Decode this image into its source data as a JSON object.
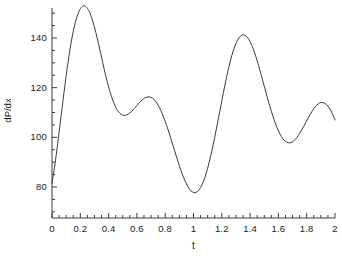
{
  "chart_data": {
    "type": "line",
    "title": "",
    "subtitle": "",
    "xlabel": "t",
    "ylabel": "dP/dx",
    "xlim": [
      0,
      2
    ],
    "ylim": [
      70,
      156
    ],
    "xticks": [
      0,
      0.2,
      0.4,
      0.6,
      0.8,
      1,
      1.2,
      1.4,
      1.6,
      1.8,
      2
    ],
    "xtick_labels": [
      "0",
      "0.2",
      "0.4",
      "0.6",
      "0.8",
      "1",
      "1.2",
      "1.4",
      "1.6",
      "1.8",
      "2"
    ],
    "yticks": [
      80,
      100,
      120,
      140
    ],
    "ytick_labels": [
      "80",
      "100",
      "120",
      "140"
    ],
    "minor_ticks": true,
    "grid": false,
    "legend": null,
    "legend_position": "none",
    "line_color": "#3a3a3a",
    "line_width": 1,
    "background_color": "#ffffff",
    "axis_color": "#3a3a3a",
    "annotations": [],
    "features": {
      "peaks": [
        {
          "t": 0.17,
          "value": 153
        },
        {
          "t": 0.62,
          "value": 124
        },
        {
          "t": 1.17,
          "value": 153
        },
        {
          "t": 1.63,
          "value": 124
        }
      ],
      "valleys": [
        {
          "t": 0.44,
          "value": 103.5
        },
        {
          "t": 0.93,
          "value": 72
        },
        {
          "t": 1.44,
          "value": 103.5
        },
        {
          "t": 1.93,
          "value": 72
        }
      ],
      "endpoints": [
        {
          "t": 0,
          "value": 81.5
        },
        {
          "t": 2,
          "value": 81.5
        }
      ],
      "period": 1.0
    },
    "series": [
      {
        "name": "dP/dx",
        "x": [
          0,
          0.02,
          0.04,
          0.06,
          0.08,
          0.1,
          0.12,
          0.14,
          0.16,
          0.18,
          0.2,
          0.22,
          0.24,
          0.26,
          0.28,
          0.3,
          0.32,
          0.34,
          0.36,
          0.38,
          0.4,
          0.42,
          0.44,
          0.46,
          0.48,
          0.5,
          0.52,
          0.54,
          0.56,
          0.58,
          0.6,
          0.62,
          0.64,
          0.66,
          0.68,
          0.7,
          0.72,
          0.74,
          0.76,
          0.78,
          0.8,
          0.82,
          0.84,
          0.86,
          0.88,
          0.9,
          0.92,
          0.94,
          0.96,
          0.98,
          1.0,
          1.02,
          1.04,
          1.06,
          1.08,
          1.1,
          1.12,
          1.14,
          1.16,
          1.18,
          1.2,
          1.22,
          1.24,
          1.26,
          1.28,
          1.3,
          1.32,
          1.34,
          1.36,
          1.38,
          1.4,
          1.42,
          1.44,
          1.46,
          1.48,
          1.5,
          1.52,
          1.54,
          1.56,
          1.58,
          1.6,
          1.62,
          1.64,
          1.66,
          1.68,
          1.7,
          1.72,
          1.74,
          1.76,
          1.78,
          1.8,
          1.82,
          1.84,
          1.86,
          1.88,
          1.9,
          1.92,
          1.94,
          1.96,
          1.98,
          2.0
        ],
        "y": [
          81.5,
          88.8,
          97.4,
          106.6,
          115.9,
          124.8,
          132.8,
          139.7,
          145.2,
          149.2,
          151.8,
          152.9,
          152.6,
          151.0,
          148.2,
          144.4,
          139.8,
          134.8,
          129.7,
          124.8,
          120.3,
          116.5,
          113.4,
          111.1,
          109.7,
          108.9,
          108.9,
          109.4,
          110.3,
          111.5,
          112.8,
          114.1,
          115.2,
          116.0,
          116.3,
          116.1,
          115.3,
          113.9,
          111.9,
          109.4,
          106.4,
          103.1,
          99.5,
          95.8,
          92.1,
          88.6,
          85.3,
          82.5,
          80.2,
          78.6,
          77.8,
          77.9,
          78.9,
          80.9,
          83.8,
          87.6,
          92.1,
          97.3,
          102.9,
          108.8,
          114.7,
          120.5,
          125.9,
          130.7,
          134.7,
          137.8,
          140.0,
          141.1,
          141.2,
          140.3,
          138.5,
          135.9,
          132.6,
          128.9,
          124.8,
          120.6,
          116.4,
          112.4,
          108.7,
          105.4,
          102.6,
          100.4,
          98.9,
          98.0,
          97.8,
          98.2,
          99.2,
          100.7,
          102.5,
          104.5,
          106.7,
          108.8,
          110.7,
          112.3,
          113.4,
          114.0,
          113.9,
          113.2,
          111.8,
          109.7,
          107.0
        ]
      }
    ],
    "curve_points_px": [
      [
        52,
        183
      ],
      [
        54.5,
        176
      ],
      [
        57,
        169
      ],
      [
        59.5,
        161
      ],
      [
        62,
        152
      ],
      [
        64.5,
        142
      ],
      [
        67,
        131
      ],
      [
        69.5,
        120
      ],
      [
        72,
        108
      ],
      [
        74.5,
        96
      ],
      [
        77,
        84
      ],
      [
        79.5,
        72
      ],
      [
        82,
        60
      ],
      [
        84.5,
        48
      ],
      [
        87,
        38
      ],
      [
        89.5,
        28
      ],
      [
        92,
        21
      ],
      [
        94.5,
        16
      ],
      [
        96.5,
        14
      ],
      [
        99,
        14
      ],
      [
        101.5,
        16
      ],
      [
        104,
        21
      ],
      [
        106.5,
        28
      ],
      [
        109,
        37
      ],
      [
        111.5,
        48
      ],
      [
        114,
        60
      ],
      [
        116.5,
        71
      ],
      [
        119,
        82
      ],
      [
        121.5,
        93
      ],
      [
        124,
        103
      ],
      [
        126.5,
        112
      ],
      [
        129,
        120
      ],
      [
        131.5,
        127
      ],
      [
        134,
        131
      ],
      [
        136.5,
        134
      ],
      [
        139,
        135
      ],
      [
        141.5,
        134
      ],
      [
        144,
        132
      ],
      [
        146.5,
        128
      ],
      [
        149,
        123
      ],
      [
        151.5,
        118
      ],
      [
        154,
        112
      ],
      [
        156.5,
        106
      ],
      [
        159,
        100
      ],
      [
        161.5,
        95
      ],
      [
        164,
        90
      ],
      [
        166.5,
        86
      ],
      [
        169,
        83
      ],
      [
        171.5,
        81
      ],
      [
        174,
        80
      ],
      [
        176.5,
        81
      ],
      [
        179,
        83
      ],
      [
        181.5,
        86
      ],
      [
        184,
        91
      ],
      [
        186.5,
        97
      ],
      [
        189,
        104
      ],
      [
        191.5,
        112
      ],
      [
        194,
        121
      ],
      [
        196.5,
        131
      ],
      [
        199,
        142
      ],
      [
        201.5,
        153
      ],
      [
        204,
        164
      ],
      [
        206.5,
        174
      ],
      [
        209,
        184
      ],
      [
        211.5,
        193
      ],
      [
        214,
        201
      ],
      [
        216.5,
        207
      ],
      [
        219,
        211
      ],
      [
        221.5,
        213
      ],
      [
        223,
        212
      ],
      [
        225.5,
        209
      ],
      [
        228,
        204
      ],
      [
        230.5,
        197
      ],
      [
        233,
        188
      ],
      [
        235.5,
        177
      ],
      [
        238,
        165
      ],
      [
        240.5,
        152
      ],
      [
        243,
        139
      ],
      [
        245.5,
        125
      ],
      [
        248,
        111
      ],
      [
        250.5,
        97
      ],
      [
        253,
        83
      ],
      [
        255.5,
        69
      ],
      [
        258,
        56
      ],
      [
        260.5,
        44
      ],
      [
        263,
        33
      ],
      [
        265.5,
        24
      ],
      [
        268,
        17
      ],
      [
        270.5,
        14
      ],
      [
        272.5,
        14
      ],
      [
        275,
        16
      ],
      [
        277.5,
        22
      ],
      [
        280,
        30
      ],
      [
        282.5,
        40
      ],
      [
        285,
        51
      ],
      [
        287.5,
        63
      ],
      [
        290,
        75
      ],
      [
        292.5,
        87
      ],
      [
        295,
        98
      ],
      [
        297.5,
        108
      ],
      [
        300,
        116
      ],
      [
        302.5,
        124
      ],
      [
        305,
        129
      ],
      [
        307.5,
        133
      ],
      [
        310,
        134
      ],
      [
        312.5,
        134
      ],
      [
        315,
        133
      ],
      [
        317.5,
        130
      ],
      [
        320,
        126
      ],
      [
        322.5,
        121
      ],
      [
        325,
        116
      ],
      [
        327.5,
        110
      ],
      [
        330,
        104
      ],
      [
        332.5,
        99
      ],
      [
        335,
        94
      ]
    ]
  }
}
